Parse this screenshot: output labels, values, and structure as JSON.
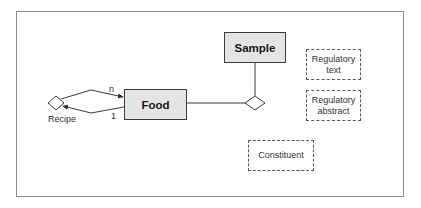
{
  "diagram": {
    "type": "entity-relationship",
    "entities": [
      {
        "id": "food",
        "label": "Food",
        "style": "shaded"
      },
      {
        "id": "sample",
        "label": "Sample",
        "style": "shaded"
      }
    ],
    "candidate_entities": [
      {
        "id": "regulatory_text",
        "line1": "Regulatory",
        "line2": "text"
      },
      {
        "id": "regulatory_abstract",
        "line1": "Regulatory",
        "line2": "abstract"
      },
      {
        "id": "constituent",
        "label": "Constituent"
      }
    ],
    "relationships": [
      {
        "id": "recipe",
        "label": "Recipe",
        "from": "food",
        "to": "food",
        "cardinality_upper": "n",
        "cardinality_lower": "1"
      },
      {
        "id": "food_sample",
        "label": "",
        "from": "food",
        "to": "sample"
      }
    ],
    "labels": {
      "food": "Food",
      "sample": "Sample",
      "recipe": "Recipe",
      "card_n": "n",
      "card_1": "1",
      "reg_text_line1": "Regulatory",
      "reg_text_line2": "text",
      "reg_abstract_line1": "Regulatory",
      "reg_abstract_line2": "abstract",
      "constituent": "Constituent"
    },
    "colors": {
      "frame": "#8a8a8a",
      "line": "#3a3a3a",
      "shade": "#e4e4e4",
      "dashed": "#555555"
    }
  }
}
